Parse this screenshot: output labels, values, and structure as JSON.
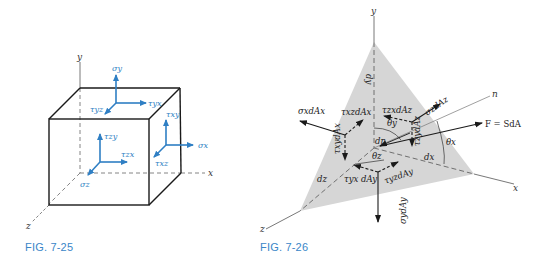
{
  "colors": {
    "caption": "#3a86c8",
    "stress_arrow": "#2f7fc4",
    "line": "#1a1a1a",
    "shade": "#d6d6d6"
  },
  "figures": [
    {
      "caption": "FIG. 7-25",
      "axes": {
        "x": "x",
        "y": "y",
        "z": "z"
      },
      "labels": {
        "sigma_y": "σy",
        "tau_yx": "τyx",
        "tau_yz": "τyz",
        "tau_zy": "τzy",
        "tau_zx": "τzx",
        "sigma_z": "σz",
        "tau_xy": "τxy",
        "sigma_x": "σx",
        "tau_xz": "τxz"
      }
    },
    {
      "caption": "FIG. 7-26",
      "axes": {
        "x": "x",
        "y": "y",
        "z": "z",
        "n": "n"
      },
      "labels": {
        "dy": "dy",
        "dx": "dx",
        "dz": "dz",
        "dn": "dn",
        "force": "F = SdA",
        "sigma_x_dAx": "σxdAx",
        "tau_xz_dAx": "τxzdAx",
        "tau_xy_dAx": "τxydAx",
        "sigma_z_dAz": "σzdAz",
        "tau_zx_dAz": "τzxdAz",
        "tau_zy_dAz": "τzydAz",
        "sigma_y_dAy": "σydAy",
        "tau_yx_dAy": "τyx dAy",
        "tau_yz_dAy": "τyzdAy",
        "theta_x": "θx",
        "theta_y": "θy",
        "theta_z": "θz"
      }
    }
  ]
}
